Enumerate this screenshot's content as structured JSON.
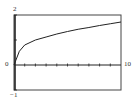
{
  "chart_data": {
    "type": "line",
    "title": "",
    "xlabel": "",
    "ylabel": "",
    "xlim": [
      0,
      10
    ],
    "ylim": [
      -1,
      2
    ],
    "grid": false,
    "legend": null,
    "x_tick_step": 1,
    "y_tick_step": 1,
    "axis_labels": {
      "x_min": "0",
      "x_max": "10",
      "y_max": "2",
      "y_min": "-1"
    },
    "series": [
      {
        "name": "curve",
        "x": [
          0,
          0.5,
          1,
          2,
          3,
          4,
          5,
          6,
          7,
          8,
          9,
          10
        ],
        "values": [
          0,
          0.55,
          0.8,
          1.0,
          1.12,
          1.24,
          1.34,
          1.43,
          1.5,
          1.58,
          1.65,
          1.72
        ]
      }
    ]
  },
  "labels": {
    "y_max": "2",
    "y_min": "−1",
    "x_origin": "0",
    "x_max": "10"
  }
}
